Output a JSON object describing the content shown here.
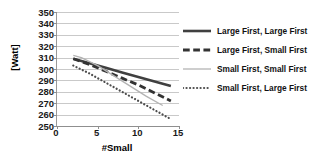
{
  "chart_data": {
    "type": "line",
    "title": "",
    "xlabel": "#Small",
    "ylabel": "[Watt]",
    "xlim": [
      0,
      15
    ],
    "ylim": [
      250,
      350
    ],
    "grid": true,
    "legend_position": "right",
    "xticks": [
      0,
      5,
      10,
      15
    ],
    "yticks": [
      250,
      260,
      270,
      280,
      290,
      300,
      310,
      320,
      330,
      340,
      350
    ],
    "series": [
      {
        "name": "Large First, Large First",
        "style": "solid",
        "color": "#404040",
        "width": 2.6,
        "x": [
          2,
          4,
          6,
          8,
          10,
          12,
          14
        ],
        "values": [
          309,
          305,
          301,
          297,
          293,
          289,
          285
        ]
      },
      {
        "name": "Large First, Small First",
        "style": "dashed",
        "color": "#333333",
        "width": 2.8,
        "x": [
          2,
          4,
          6,
          8,
          10,
          12,
          14
        ],
        "values": [
          309,
          304,
          298,
          292,
          286,
          279,
          272
        ]
      },
      {
        "name": "Small First, Small First",
        "style": "solid",
        "color": "#b3b3b3",
        "width": 1.3,
        "x": [
          2,
          3,
          5,
          7,
          9,
          11,
          13
        ],
        "values": [
          312,
          310,
          303,
          294,
          285,
          276,
          268
        ]
      },
      {
        "name": "Small First, Large First",
        "style": "dotted",
        "color": "#4d4d4d",
        "width": 2.2,
        "x": [
          2,
          4,
          6,
          8,
          10,
          12,
          14
        ],
        "values": [
          303,
          296,
          288,
          280,
          272,
          264,
          256
        ]
      }
    ]
  }
}
